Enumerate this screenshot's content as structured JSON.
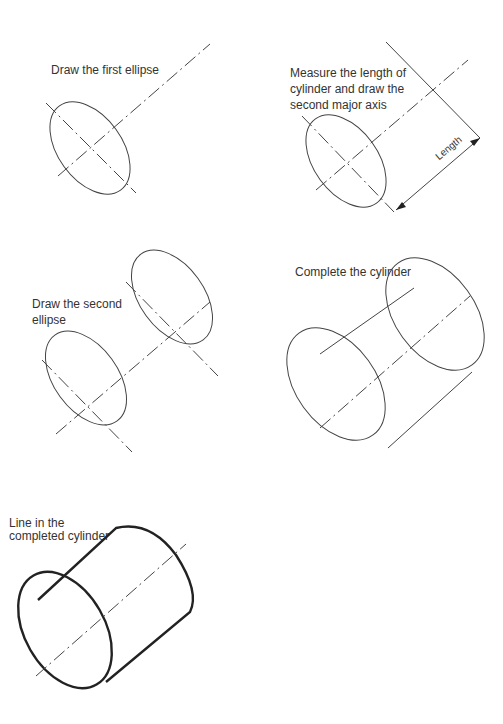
{
  "steps": [
    {
      "id": 1,
      "label": "Draw the first ellipse"
    },
    {
      "id": 2,
      "label_lines": [
        "Measure the length of",
        "cylinder and draw the",
        "second major axis"
      ],
      "dimension_label": "Length"
    },
    {
      "id": 3,
      "label_lines": [
        "Draw the second",
        "ellipse"
      ]
    },
    {
      "id": 4,
      "label": "Complete the cylinder"
    },
    {
      "id": 5,
      "label_lines": [
        "Line in the",
        "completed cylinder"
      ]
    }
  ],
  "colors": {
    "line": "#444444",
    "text": "#333333",
    "background": "#ffffff"
  }
}
